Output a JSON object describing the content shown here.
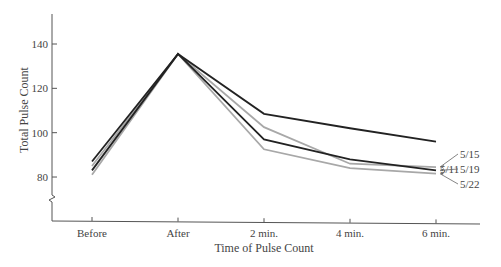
{
  "chart_data": {
    "type": "line",
    "title": "",
    "xlabel": "Time of Pulse Count",
    "ylabel": "Total Pulse Count",
    "categories": [
      "Before",
      "After",
      "2 min.",
      "4 min.",
      "6 min."
    ],
    "yticks": [
      80,
      100,
      120,
      140
    ],
    "ylim": [
      70,
      155
    ],
    "axis_break": true,
    "grid": false,
    "series": [
      {
        "name": "5/11",
        "color": "#222222",
        "values": [
          87,
          135.5,
          108.5,
          102,
          96
        ]
      },
      {
        "name": "5/15",
        "color": "#a8a8a8",
        "values": [
          85,
          135.5,
          102.5,
          86,
          84.5
        ]
      },
      {
        "name": "5/19",
        "color": "#222222",
        "values": [
          83,
          135.5,
          97,
          88,
          83
        ]
      },
      {
        "name": "5/22",
        "color": "#a8a8a8",
        "values": [
          81,
          135.5,
          92.5,
          84,
          81.5
        ]
      }
    ],
    "legend": "inline-right"
  }
}
